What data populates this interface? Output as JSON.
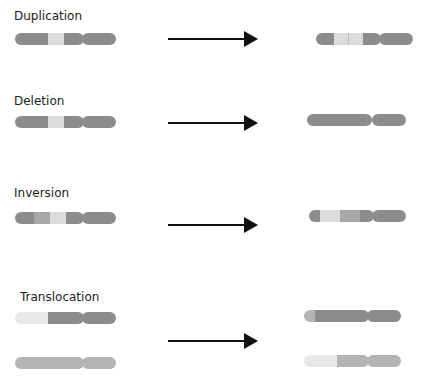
{
  "colors": {
    "dark": "#8c8c8c",
    "medium": "#a8a8a8",
    "light": "#dcdcdc",
    "pale": "#e8e8e8",
    "arrow": "#111111"
  },
  "sections": [
    {
      "id": "duplication",
      "label": "Duplication"
    },
    {
      "id": "deletion",
      "label": "Deletion"
    },
    {
      "id": "inversion",
      "label": "Inversion"
    },
    {
      "id": "translocation",
      "label": "Translocation"
    }
  ]
}
